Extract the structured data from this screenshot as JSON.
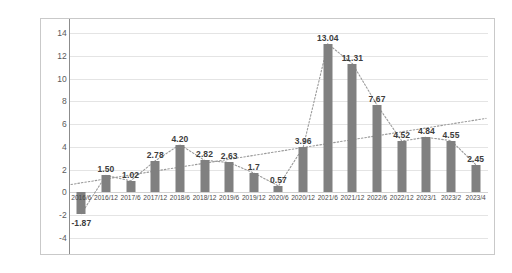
{
  "chart_data": {
    "type": "bar",
    "title": "",
    "subtitle": "",
    "xlabel": "",
    "ylabel": "",
    "categories": [
      "2016/6",
      "2016/12",
      "2017/6",
      "2017/12",
      "2018/6",
      "2018/12",
      "2019/6",
      "2019/12",
      "2020/6",
      "2020/12",
      "2021/6",
      "2021/12",
      "2022/6",
      "2022/12",
      "2023/1",
      "2023/2",
      "2023/4"
    ],
    "values": [
      -1.87,
      1.5,
      1.02,
      2.78,
      4.2,
      2.82,
      2.63,
      1.7,
      0.57,
      3.96,
      13.04,
      11.31,
      7.67,
      4.52,
      4.84,
      4.55,
      2.45
    ],
    "data_labels": [
      "-1.87",
      "1.50",
      "1.02",
      "2.78",
      "4.20",
      "2.82",
      "2.63",
      "1.7",
      "0.57",
      "3.96",
      "13.04",
      "11.31",
      "7.67",
      "4.52",
      "4.84",
      "4.55",
      "2.45"
    ],
    "ylim": [
      -4,
      14
    ],
    "ytick_step": 2,
    "yticks": [
      14,
      12,
      10,
      8,
      6,
      4,
      2,
      0,
      -2,
      -4
    ],
    "ytick_labels": [
      "14",
      "12",
      "10",
      "8",
      "6",
      "4",
      "2",
      "0",
      "-2",
      "-4"
    ],
    "grid": true,
    "legend": "none",
    "series": [
      {
        "name": "bars",
        "type": "bar",
        "color": "#808080",
        "values": [
          -1.87,
          1.5,
          1.02,
          2.78,
          4.2,
          2.82,
          2.63,
          1.7,
          0.57,
          3.96,
          13.04,
          11.31,
          7.67,
          4.52,
          4.84,
          4.55,
          2.45
        ]
      },
      {
        "name": "connector",
        "type": "line",
        "style": "dotted",
        "color": "#9a9a9a",
        "values": [
          -1.87,
          1.5,
          1.02,
          2.78,
          4.2,
          2.82,
          2.63,
          1.7,
          0.57,
          3.96,
          13.04,
          11.31,
          7.67,
          4.52,
          4.84,
          4.55,
          2.45
        ]
      },
      {
        "name": "trendline",
        "type": "line",
        "style": "dotted",
        "color": "#9a9a9a",
        "start_value": 0.7,
        "end_value": 6.5
      }
    ],
    "colors": {
      "bar": "#808080",
      "grid": "#e4e4e4",
      "axis": "#8c8c8c",
      "label_text": "#3d3d3d",
      "tick_text": "#5a5a5a",
      "frame": "#c9c9c9",
      "background": "#ffffff"
    }
  }
}
